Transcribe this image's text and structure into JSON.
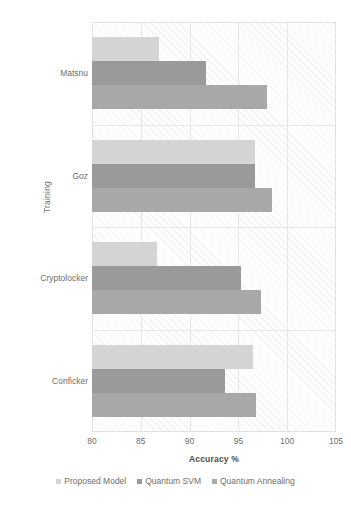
{
  "chart_data": {
    "type": "bar",
    "orientation": "horizontal",
    "title": "",
    "xlabel": "Accuracy %",
    "ylabel": "Training",
    "categories": [
      "Conficker",
      "Cryptolocker",
      "Goz",
      "Matsnu"
    ],
    "categories_top_to_bottom": [
      "Matsnu",
      "Goz",
      "Cryptolocker",
      "Conficker"
    ],
    "series": [
      {
        "name": "Proposed Model",
        "color": "#d4d4d4",
        "values": [
          96.5,
          86.7,
          96.7,
          86.9
        ]
      },
      {
        "name": "Quantum SVM",
        "color": "#9a9a9a",
        "values": [
          93.6,
          95.3,
          96.7,
          91.7
        ]
      },
      {
        "name": "Quantum Annealing",
        "color": "#a8a8a8",
        "values": [
          96.8,
          97.3,
          98.4,
          97.9
        ]
      }
    ],
    "xlim": [
      80,
      105
    ],
    "xticks": [
      80,
      85,
      90,
      95,
      100,
      105
    ],
    "xtick_labels": [
      "80",
      "85",
      "90",
      "95",
      "100",
      "105"
    ],
    "grid": true,
    "legend_position": "bottom",
    "plot_background": "diagonal-hatch"
  },
  "legend": {
    "items": [
      {
        "label": "Proposed Model",
        "color": "#d4d4d4"
      },
      {
        "label": "Quantum SVM",
        "color": "#9a9a9a"
      },
      {
        "label": "Quantum Annealing",
        "color": "#a8a8a8"
      }
    ]
  },
  "axes": {
    "x_title": "Accuracy %",
    "y_title": "Training"
  }
}
